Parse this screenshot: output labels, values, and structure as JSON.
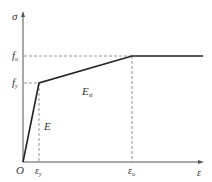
{
  "diagram": {
    "type": "bilinear-stress-strain-curve",
    "axes": {
      "y_label": "σ",
      "x_label": "ε",
      "origin_label": "O"
    },
    "y_ticks": {
      "fu": {
        "main": "f",
        "sub": "u"
      },
      "fy": {
        "main": "f",
        "sub": "y"
      }
    },
    "x_ticks": {
      "ey": {
        "main": "ε",
        "sub": "y"
      },
      "eu": {
        "main": "ε",
        "sub": "u"
      }
    },
    "segment_labels": {
      "elastic": "E",
      "hardening": {
        "main": "E",
        "sub": "st"
      }
    },
    "points": [
      {
        "name": "origin",
        "x": 23,
        "y": 162
      },
      {
        "name": "yield",
        "x": 39,
        "y": 83
      },
      {
        "name": "ultimate",
        "x": 132,
        "y": 56
      },
      {
        "name": "plateau-end",
        "x": 203,
        "y": 56
      }
    ],
    "colors": {
      "curve": "#222222",
      "axes": "#444444",
      "dashed": "#777777",
      "text": "#333333"
    }
  }
}
